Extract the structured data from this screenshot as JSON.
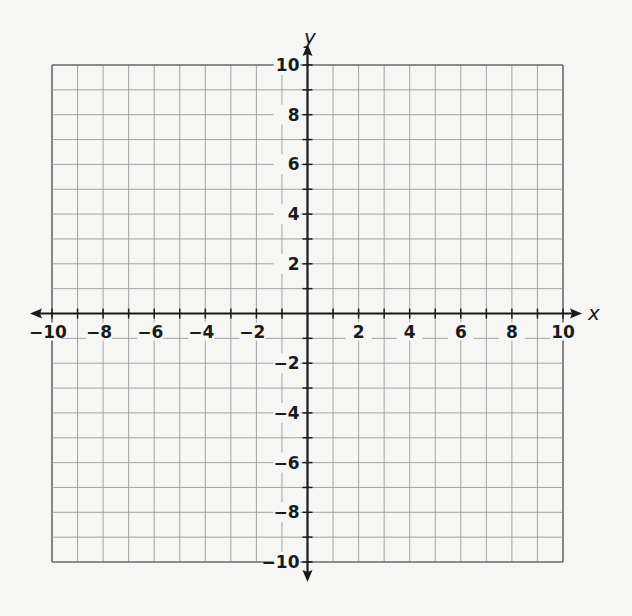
{
  "chart_data": {
    "type": "scatter",
    "title": "",
    "xlabel": "x",
    "ylabel": "y",
    "xlim": [
      -10,
      10
    ],
    "ylim": [
      -10,
      10
    ],
    "grid": true,
    "grid_step": 1,
    "x_tick_labels": [
      "−10",
      "−8",
      "−6",
      "−4",
      "−2",
      "2",
      "4",
      "6",
      "8",
      "10"
    ],
    "x_tick_values": [
      -10,
      -8,
      -6,
      -4,
      -2,
      2,
      4,
      6,
      8,
      10
    ],
    "y_tick_labels": [
      "10",
      "8",
      "6",
      "4",
      "2",
      "−2",
      "−4",
      "−6",
      "−8",
      "−10"
    ],
    "y_tick_values": [
      10,
      8,
      6,
      4,
      2,
      -2,
      -4,
      -6,
      -8,
      -10
    ],
    "series": [],
    "legend": null
  },
  "axes": {
    "x_label": "x",
    "y_label": "y"
  },
  "colors": {
    "background": "#f6f6f5",
    "grid": "#9a9a9a",
    "axis": "#1a1a1a",
    "text": "#1a1a1a"
  }
}
